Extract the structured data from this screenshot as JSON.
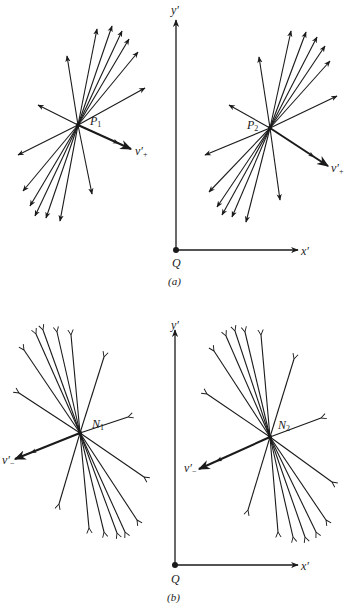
{
  "figure": {
    "panels": [
      {
        "id": "a",
        "caption": "(a)",
        "axes": {
          "origin_label": "Q",
          "x_label": "x′",
          "y_label": "y′",
          "origin": [
            176,
            250
          ],
          "x_end": [
            298,
            250
          ],
          "y_end": [
            176,
            20
          ]
        },
        "sources": [
          {
            "label": "P",
            "subscript": "1",
            "center": [
              78,
              125
            ],
            "velocity_label": "v′₊",
            "velocity_tip": [
              131,
              149
            ],
            "rays": [
              [
                67,
                56
              ],
              [
                97,
                29
              ],
              [
                112,
                26
              ],
              [
                122,
                31
              ],
              [
                129,
                39
              ],
              [
                138,
                52
              ],
              [
                145,
                88
              ],
              [
                38,
                105
              ],
              [
                18,
                155
              ],
              [
                23,
                191
              ],
              [
                30,
                206
              ],
              [
                35,
                216
              ],
              [
                46,
                218
              ],
              [
                60,
                221
              ],
              [
                92,
                194
              ]
            ]
          },
          {
            "label": "P",
            "subscript": "2",
            "center": [
              270,
              128
            ],
            "velocity_label": "v′₊",
            "velocity_tip": [
              328,
              166
            ],
            "rays": [
              [
                259,
                57
              ],
              [
                291,
                31
              ],
              [
                306,
                32
              ],
              [
                317,
                37
              ],
              [
                325,
                46
              ],
              [
                330,
                61
              ],
              [
                337,
                96
              ],
              [
                229,
                105
              ],
              [
                205,
                155
              ],
              [
                209,
                192
              ],
              [
                217,
                207
              ],
              [
                222,
                215
              ],
              [
                232,
                217
              ],
              [
                246,
                222
              ],
              [
                280,
                200
              ]
            ]
          }
        ]
      },
      {
        "id": "b",
        "caption": "(b)",
        "axes": {
          "origin_label": "Q",
          "x_label": "x′",
          "y_label": "y′",
          "origin": [
            175,
            565
          ],
          "x_end": [
            298,
            565
          ],
          "y_end": [
            175,
            330
          ]
        },
        "sources": [
          {
            "label": "N",
            "subscript": "1",
            "center": [
              80,
              433
            ],
            "velocity_label": "v′₋",
            "velocity_tip": [
              15,
              459
            ],
            "rays": [
              [
                24,
                350
              ],
              [
                36,
                334
              ],
              [
                43,
                330
              ],
              [
                57,
                332
              ],
              [
                71,
                335
              ],
              [
                104,
                357
              ],
              [
                19,
                393
              ],
              [
                128,
                417
              ],
              [
                144,
                477
              ],
              [
                59,
                504
              ],
              [
                89,
                528
              ],
              [
                104,
                532
              ],
              [
                117,
                533
              ],
              [
                125,
                532
              ],
              [
                137,
                520
              ]
            ]
          },
          {
            "label": "N",
            "subscript": "2",
            "center": [
              270,
              437
            ],
            "velocity_label": "v′₋",
            "velocity_tip": [
              199,
              469
            ],
            "rays": [
              [
                214,
                351
              ],
              [
                226,
                336
              ],
              [
                235,
                331
              ],
              [
                245,
                332
              ],
              [
                261,
                335
              ],
              [
                294,
                359
              ],
              [
                207,
                394
              ],
              [
                321,
                418
              ],
              [
                332,
                482
              ],
              [
                248,
                510
              ],
              [
                278,
                532
              ],
              [
                293,
                537
              ],
              [
                305,
                537
              ],
              [
                316,
                532
              ],
              [
                326,
                520
              ]
            ]
          }
        ]
      }
    ]
  },
  "labels": {
    "p1": "P",
    "p1_sub": "1",
    "p2": "P",
    "p2_sub": "2",
    "n1": "N",
    "n1_sub": "1",
    "n2": "N",
    "n2_sub": "2",
    "v_plus": "v′",
    "v_plus_sub": "+",
    "v_minus": "v′",
    "v_minus_sub": "−",
    "q": "Q",
    "x": "x′",
    "y": "y′",
    "cap_a": "(a)",
    "cap_b": "(b)"
  },
  "colors": {
    "ink": "#1a1a1a",
    "background": "#ffffff"
  }
}
